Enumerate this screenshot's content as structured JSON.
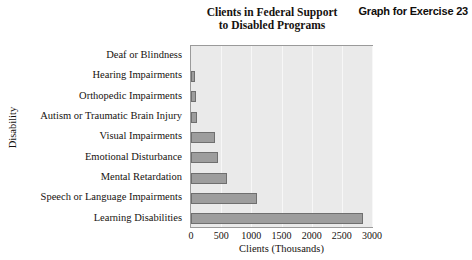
{
  "exercise_caption": "Graph for Exercise  23",
  "chart_data": {
    "type": "bar",
    "orientation": "horizontal",
    "title": "Clients in Federal Support to Disabled Programs",
    "title_lines": [
      "Clients in Federal Support",
      "to Disabled Programs"
    ],
    "xlabel": "Clients (Thousands)",
    "ylabel": "Disability",
    "categories": [
      "Deaf or Blindness",
      "Hearing Impairments",
      "Orthopedic Impairments",
      "Autism or Traumatic Brain Injury",
      "Visual Impairments",
      "Emotional Disturbance",
      "Mental Retardation",
      "Speech or Language Impairments",
      "Learning Disabilities"
    ],
    "values": [
      0,
      70,
      75,
      100,
      400,
      450,
      600,
      1100,
      2850
    ],
    "xticks": [
      0,
      500,
      1000,
      1500,
      2000,
      2500,
      3000
    ],
    "xtick_labels": [
      "0",
      "500",
      "1000",
      "1500",
      "2000",
      "2500",
      "3000"
    ],
    "xlim": [
      0,
      3000
    ],
    "grid": true,
    "grid_axis": "x",
    "legend": false,
    "bar_color": "#9d9d9d",
    "bar_edge_color": "#6f6f6f",
    "plot_background": "#eaeaea",
    "gridline_color": "#f7f7f7"
  }
}
